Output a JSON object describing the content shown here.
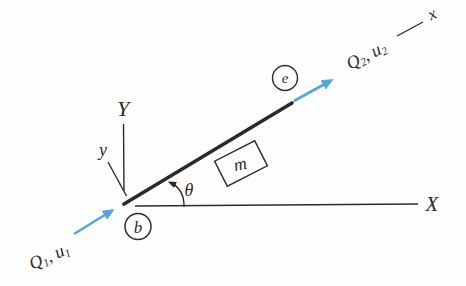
{
  "figure": {
    "colors": {
      "line": "#2b2b2b",
      "arrow": "#52a6d8",
      "background": "#fefefe"
    },
    "axes": {
      "global_x": "X",
      "global_y": "Y",
      "local_x": "x",
      "local_y": "y"
    },
    "nodes": {
      "begin": "b",
      "end": "e"
    },
    "angle": "θ",
    "mass": "m",
    "forces": {
      "q1": {
        "force": "Q",
        "force_sub": "1",
        "sep": ", ",
        "disp": "u",
        "disp_sub": "1"
      },
      "q2": {
        "force": "Q",
        "force_sub": "2",
        "sep": ", ",
        "disp": "u",
        "disp_sub": "2"
      }
    }
  }
}
